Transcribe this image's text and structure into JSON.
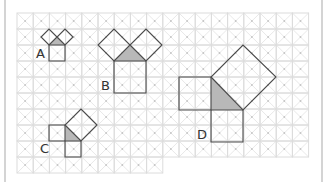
{
  "diagram": {
    "colors": {
      "grid_line": "#dcdcdc",
      "grid_diagonal": "#e2e2e2",
      "grid_dot": "#c4c4c4",
      "outline": "#4a4a4a",
      "triangle_fill": "#b8b8b8",
      "border": "#d4d4d4"
    },
    "grid": {
      "x0": 17,
      "y0": 13,
      "cell_w": 16.2,
      "cell_h": 16,
      "regions": [
        {
          "col_start": 0,
          "col_end": 9,
          "row_start": 0,
          "row_end": 10
        },
        {
          "col_start": 9,
          "col_end": 18,
          "row_start": 0,
          "row_end": 9
        }
      ]
    },
    "figures": [
      {
        "label": "A",
        "label_pos": [
          36,
          58
        ],
        "triangle": [
          [
            49,
            45
          ],
          [
            65,
            45
          ],
          [
            57,
            37
          ]
        ],
        "squares": [
          [
            [
              49,
              45
            ],
            [
              65,
              45
            ],
            [
              65,
              61
            ],
            [
              49,
              61
            ]
          ],
          [
            [
              49,
              45
            ],
            [
              57,
              37
            ],
            [
              49,
              29
            ],
            [
              41,
              37
            ]
          ],
          [
            [
              57,
              37
            ],
            [
              65,
              45
            ],
            [
              73,
              37
            ],
            [
              65,
              29
            ]
          ]
        ]
      },
      {
        "label": "B",
        "label_pos": [
          101,
          90
        ],
        "triangle": [
          [
            114,
            61
          ],
          [
            146,
            61
          ],
          [
            130,
            45
          ]
        ],
        "squares": [
          [
            [
              114,
              61
            ],
            [
              146,
              61
            ],
            [
              146,
              93
            ],
            [
              114,
              93
            ]
          ],
          [
            [
              114,
              61
            ],
            [
              130,
              45
            ],
            [
              114,
              29
            ],
            [
              98,
              45
            ]
          ],
          [
            [
              130,
              45
            ],
            [
              146,
              61
            ],
            [
              162,
              45
            ],
            [
              146,
              29
            ]
          ]
        ]
      },
      {
        "label": "C",
        "label_pos": [
          40,
          153
        ],
        "triangle": [
          [
            65,
            125
          ],
          [
            65,
            141
          ],
          [
            81,
            141
          ]
        ],
        "squares": [
          [
            [
              49,
              125
            ],
            [
              65,
              125
            ],
            [
              65,
              141
            ],
            [
              49,
              141
            ]
          ],
          [
            [
              65,
              141
            ],
            [
              81,
              141
            ],
            [
              81,
              157
            ],
            [
              65,
              157
            ]
          ],
          [
            [
              65,
              125
            ],
            [
              81,
              141
            ],
            [
              97,
              125
            ],
            [
              81,
              109
            ]
          ]
        ]
      },
      {
        "label": "D",
        "label_pos": [
          197,
          139
        ],
        "triangle": [
          [
            211,
            77
          ],
          [
            211,
            110
          ],
          [
            243,
            110
          ]
        ],
        "squares": [
          [
            [
              179,
              77
            ],
            [
              211,
              77
            ],
            [
              211,
              110
            ],
            [
              179,
              110
            ]
          ],
          [
            [
              211,
              110
            ],
            [
              243,
              110
            ],
            [
              243,
              142
            ],
            [
              211,
              142
            ]
          ],
          [
            [
              211,
              77
            ],
            [
              243,
              110
            ],
            [
              276,
              77
            ],
            [
              243,
              45
            ]
          ]
        ]
      }
    ]
  }
}
